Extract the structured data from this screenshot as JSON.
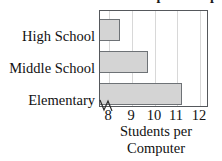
{
  "chart_data": {
    "type": "bar",
    "orientation": "horizontal",
    "title": "Students per Computer",
    "title_visible_partially": true,
    "categories": [
      "High School",
      "Middle School",
      "Elementary"
    ],
    "values": [
      8.5,
      9.7,
      11.2
    ],
    "xlabel_line1": "Students per",
    "xlabel_line2": "Computer",
    "ylabel": "",
    "xlim": [
      7.6,
      12.4
    ],
    "xticks": [
      8,
      9,
      10,
      11,
      12
    ],
    "xtick_labels": [
      "8",
      "9",
      "10",
      "11",
      "12"
    ],
    "axis_break": true,
    "grid": "vertical",
    "legend": "none",
    "bar_fill_color": "#d4d4d4",
    "bar_border_color": "#6e7276",
    "gridline_color": "#d8d8d8",
    "frame_color": "#55585c",
    "background_color": "#ffffff"
  }
}
